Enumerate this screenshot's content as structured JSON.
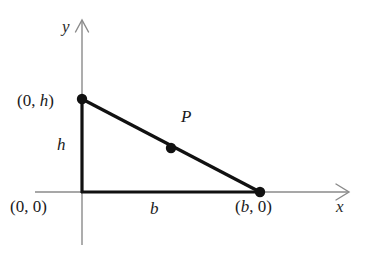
{
  "figure": {
    "type": "geometry-diagram",
    "background_color": "#ffffff",
    "line_color": "#111111",
    "axis_color": "#8a8a8a"
  },
  "axes": {
    "x_label": "x",
    "y_label": "y",
    "x_arrow": "open-arrow-right",
    "y_arrow": "open-arrow-up"
  },
  "labels": {
    "origin": "(0, 0)",
    "vertex_top": "(0, h)",
    "vertex_right": "(b, 0)",
    "base": "b",
    "height": "h",
    "point": "P"
  },
  "chart_data": {
    "type": "scatter",
    "title": "",
    "xlabel": "x",
    "ylabel": "y",
    "points": [
      {
        "name": "(0, h)",
        "x": 0,
        "y": "h",
        "marked": true
      },
      {
        "name": "(b, 0)",
        "x": "b",
        "y": 0,
        "marked": true
      },
      {
        "name": "P",
        "x": "b/2",
        "y": "h/2",
        "marked": true
      },
      {
        "name": "(0, 0)",
        "x": 0,
        "y": 0,
        "marked": false
      }
    ],
    "segments": [
      {
        "from": "(0, h)",
        "to": "(0, 0)",
        "label": "h"
      },
      {
        "from": "(0, 0)",
        "to": "(b, 0)",
        "label": "b"
      },
      {
        "from": "(0, h)",
        "to": "(b, 0)",
        "label": ""
      }
    ],
    "legend": []
  }
}
